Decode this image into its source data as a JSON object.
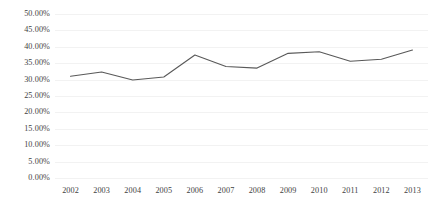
{
  "chart_data": {
    "type": "line",
    "title": "",
    "subtitle": "",
    "xlabel": "",
    "ylabel": "",
    "categories": [
      "2002",
      "2003",
      "2004",
      "2005",
      "2006",
      "2007",
      "2008",
      "2009",
      "2010",
      "2011",
      "2012",
      "2013"
    ],
    "series": [
      {
        "name": "",
        "values": [
          31.0,
          32.3,
          29.9,
          30.8,
          37.5,
          34.0,
          33.5,
          38.0,
          38.5,
          35.6,
          36.2,
          39.0
        ]
      }
    ],
    "ylim": [
      0,
      50
    ],
    "ytick_values": [
      0,
      5,
      10,
      15,
      20,
      25,
      30,
      35,
      40,
      45,
      50
    ],
    "ytick_labels": [
      "0.00%",
      "5.00%",
      "10.00%",
      "15.00%",
      "20.00%",
      "25.00%",
      "30.00%",
      "35.00%",
      "40.00%",
      "45.00%",
      "50.00%"
    ],
    "grid": true,
    "legend": false,
    "legend_position": "none",
    "line_color": "#595959",
    "grid_color": "#f2f2f2",
    "background_color": "#ffffff",
    "text_color": "#3f3f3f"
  }
}
